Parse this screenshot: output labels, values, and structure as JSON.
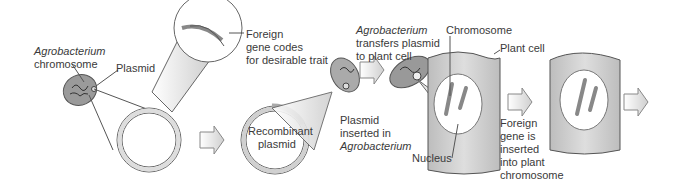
{
  "labels": {
    "agro_chrom_1": "Agrobacterium",
    "agro_chrom_2": "chromosome",
    "plasmid": "Plasmid",
    "foreign_1": "Foreign",
    "foreign_2": "gene codes",
    "foreign_3": "for desirable trait",
    "recombinant_1": "Recombinant",
    "recombinant_2": "plasmid",
    "inserted_1": "Plasmid",
    "inserted_2": "inserted in",
    "inserted_3": "Agrobacterium",
    "transfer_1": "Agrobacterium",
    "transfer_2": "transfers plasmid",
    "transfer_3": "to plant cell",
    "chromosome": "Chromosome",
    "plant_cell": "Plant cell",
    "nucleus": "Nucleus",
    "fg_1": "Foreign",
    "fg_2": "gene is",
    "fg_3": "inserted",
    "fg_4": "into plant",
    "fg_5": "chromosome"
  },
  "colors": {
    "outline": "#555555",
    "cell_fill": "#cfcfcf",
    "arrow_fill": "#e8e8e8",
    "bacterium_fill": "#9a9a9a"
  }
}
